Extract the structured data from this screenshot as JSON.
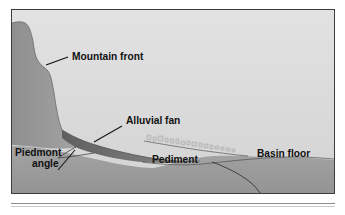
{
  "figure": {
    "kind": "geologic-cross-section",
    "labels": {
      "mountain_front": "Mountain front",
      "alluvial_fan": "Alluvial fan",
      "piedmont_angle_line1": "Piedmont",
      "piedmont_angle_line2": "angle",
      "pediment": "Pediment",
      "basin_floor": "Basin floor"
    },
    "colors": {
      "sky": "#dcdcdc",
      "mountain": "#9a9a9a",
      "pediment": "#9e9e9e",
      "basin_fill": "#a6a6a6",
      "alluvial_fan": "#6e6e6e",
      "debris": "#cfcfcf",
      "line": "#111111",
      "frame_border": "#3c3c3c",
      "page_background": "#ffffff",
      "caption_rule": "#8d8d8d"
    }
  }
}
